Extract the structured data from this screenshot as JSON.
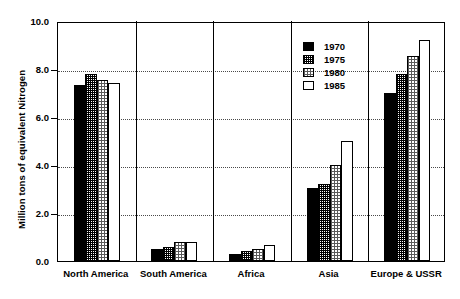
{
  "chart_data": {
    "type": "bar",
    "title": "",
    "xlabel": "",
    "ylabel": "Million tons of equivalent Nitrogen",
    "ylim": [
      0.0,
      10.0
    ],
    "yticks": [
      "0.0",
      "2.0",
      "4.0",
      "6.0",
      "8.0",
      "10.0"
    ],
    "ytick_values": [
      0.0,
      2.0,
      4.0,
      6.0,
      8.0,
      10.0
    ],
    "grid": "horizontal-dotted",
    "legend_position": "upper-center",
    "categories": [
      "North America",
      "South America",
      "Africa",
      "Asia",
      "Europe & USSR"
    ],
    "series": [
      {
        "name": "1970",
        "pattern": "solid-black",
        "values": [
          7.35,
          0.5,
          0.3,
          3.05,
          7.0
        ]
      },
      {
        "name": "1975",
        "pattern": "dense-dither",
        "values": [
          7.8,
          0.6,
          0.4,
          3.2,
          7.8
        ]
      },
      {
        "name": "1980",
        "pattern": "light-dither",
        "values": [
          7.55,
          0.8,
          0.5,
          4.0,
          8.55
        ]
      },
      {
        "name": "1985",
        "pattern": "white",
        "values": [
          7.4,
          0.8,
          0.65,
          5.0,
          9.2
        ]
      }
    ]
  },
  "legend": {
    "entries": [
      {
        "label": "1970"
      },
      {
        "label": "1975"
      },
      {
        "label": "1980"
      },
      {
        "label": "1985"
      }
    ]
  },
  "axis": {
    "y_title": "Million tons of equivalent Nitrogen",
    "y_labels": [
      "10.0",
      "8.0",
      "6.0",
      "4.0",
      "2.0",
      "0.0"
    ],
    "x_labels": [
      "North America",
      "South America",
      "Africa",
      "Asia",
      "Europe & USSR"
    ]
  },
  "colors": {
    "frame": "#000000",
    "grid": "#4a4a4a",
    "series_1970": "#000000",
    "series_1975": "#7a7a7a",
    "series_1980": "#c8c8c8",
    "series_1985": "#ffffff",
    "background": "#ffffff"
  }
}
